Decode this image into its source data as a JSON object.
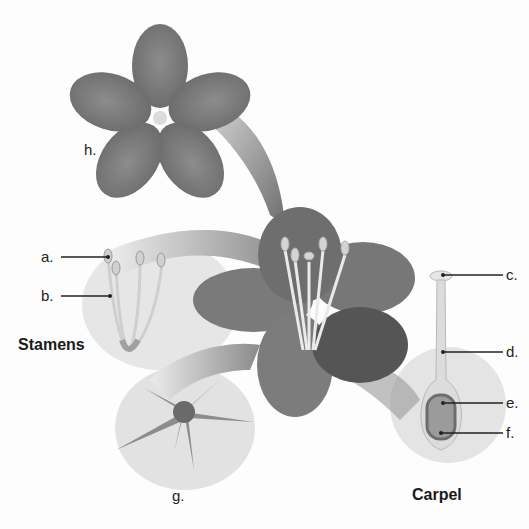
{
  "diagram": {
    "parts": {
      "stamens": {
        "title": "Stamens",
        "labels": [
          {
            "letter": "a."
          },
          {
            "letter": "b."
          }
        ]
      },
      "carpel": {
        "title": "Carpel",
        "labels": [
          {
            "letter": "c."
          },
          {
            "letter": "d."
          },
          {
            "letter": "e."
          },
          {
            "letter": "f."
          }
        ]
      },
      "sepals": {
        "label": "g."
      },
      "petals": {
        "label": "h."
      }
    },
    "colors": {
      "petal": "#7d7d7d",
      "petal_dark": "#4e4e4e",
      "halo": "#e4e4e4",
      "leader_line": "#222222"
    }
  }
}
